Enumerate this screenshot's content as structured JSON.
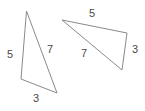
{
  "figure": {
    "type": "geometry-diagram",
    "background_color": "#ffffff",
    "stroke_color": "#8a8a8a",
    "label_color": "#4a4a4a",
    "stroke_width": 1,
    "canvas": {
      "width": 145,
      "height": 111
    },
    "shapes": [
      {
        "name": "left-triangle",
        "vertices": [
          {
            "name": "apex",
            "x": 26.5,
            "y": 11
          },
          {
            "name": "bottom-left",
            "x": 21,
            "y": 79
          },
          {
            "name": "bottom-right",
            "x": 57,
            "y": 93
          }
        ],
        "points_attr": "26.5,11 21,79 57,93",
        "labels": [
          {
            "name": "left-side",
            "text": "5",
            "x": 7,
            "y": 49
          },
          {
            "name": "right-side",
            "text": "7",
            "x": 47,
            "y": 44
          },
          {
            "name": "bottom-side",
            "text": "3",
            "x": 33,
            "y": 93
          }
        ]
      },
      {
        "name": "right-triangle",
        "vertices": [
          {
            "name": "left",
            "x": 62,
            "y": 20
          },
          {
            "name": "top-right",
            "x": 127,
            "y": 33
          },
          {
            "name": "bottom-right",
            "x": 122,
            "y": 70
          }
        ],
        "points_attr": "62,20 127,33 122,70",
        "labels": [
          {
            "name": "top-side",
            "text": "5",
            "x": 89,
            "y": 8
          },
          {
            "name": "right-side",
            "text": "3",
            "x": 132,
            "y": 44
          },
          {
            "name": "hypotenuse-side",
            "text": "7",
            "x": 81,
            "y": 48
          }
        ]
      }
    ]
  }
}
